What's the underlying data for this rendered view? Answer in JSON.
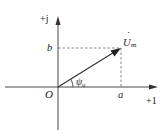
{
  "diagram": {
    "type": "phasor-diagram",
    "axes": {
      "real_label": "+1",
      "imag_label": "+j",
      "origin_label": "O"
    },
    "phasor": {
      "name": "U",
      "subscript": "m",
      "dot": "·",
      "real_component_label": "a",
      "imag_component_label": "b",
      "angle_label": "ψ",
      "angle_subscript": "u"
    },
    "colors": {
      "line": "#333333",
      "dashed": "#555555",
      "background": "#ffffff"
    }
  }
}
